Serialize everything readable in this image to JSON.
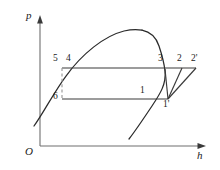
{
  "figure": {
    "name": "pressure-enthalpy-cycle-diagram",
    "width": 220,
    "height": 170,
    "background": "#ffffff",
    "stroke_color": "#2b2b2b",
    "dashed_color": "#8c8c8c"
  },
  "axes": {
    "y_label": "p",
    "x_label": "h",
    "origin_label": "O",
    "y_axis": {
      "x": 40,
      "y_top": 18,
      "y_bottom": 146
    },
    "x_axis": {
      "y": 146,
      "x_left": 40,
      "x_right": 206
    },
    "arrowheads": true
  },
  "state_points": [
    {
      "id": "1",
      "label": "1",
      "x": 147,
      "y": 99,
      "label_x": 140,
      "label_y": 87
    },
    {
      "id": "1p",
      "label": "1'",
      "x": 168,
      "y": 99,
      "label_x": 164,
      "label_y": 101
    },
    {
      "id": "2",
      "label": "2",
      "x": 182,
      "y": 68,
      "label_x": 178,
      "label_y": 55
    },
    {
      "id": "2p",
      "label": "2'",
      "x": 196,
      "y": 68,
      "label_x": 192,
      "label_y": 55
    },
    {
      "id": "3",
      "label": "3",
      "x": 164,
      "y": 68,
      "label_x": 159,
      "label_y": 55
    },
    {
      "id": "4",
      "label": "4",
      "x": 71,
      "y": 68,
      "label_x": 67,
      "label_y": 55
    },
    {
      "id": "5",
      "label": "5",
      "x": 62,
      "y": 68,
      "label_x": 54,
      "label_y": 55
    },
    {
      "id": "6",
      "label": "6",
      "x": 62,
      "y": 99,
      "label_x": 54,
      "label_y": 93
    }
  ],
  "process_lines": {
    "upper_isobar": {
      "from": "5",
      "to": "2p",
      "y": 68,
      "x_start": 62,
      "x_end": 196,
      "style": "solid"
    },
    "lower_isobar": {
      "from": "6",
      "to": "1p",
      "y": 99,
      "x_start": 62,
      "x_end": 168,
      "style": "solid"
    },
    "compression_1_2": {
      "from": "1p",
      "to": "2",
      "style": "solid"
    },
    "compression_1_2p": {
      "from": "1p",
      "to": "2p",
      "style": "solid"
    },
    "compression_inner": {
      "from": "1p",
      "to": "3",
      "style": "solid"
    },
    "throttle_5_6": {
      "from": "5",
      "to": "6",
      "style": "dashed"
    }
  },
  "saturation_dome": {
    "description": "two-phase saturation dome curve",
    "peak": {
      "x": 142,
      "y": 30
    },
    "left_tail": {
      "x": 34,
      "y": 126
    },
    "right_tail": {
      "x": 129,
      "y": 139
    }
  }
}
